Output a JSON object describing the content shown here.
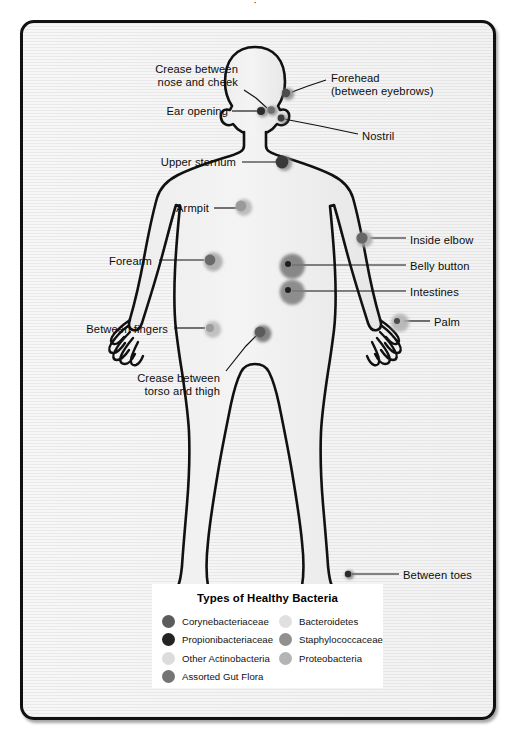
{
  "figure": {
    "top_caption_fragment": "·",
    "body_fill": "#f0f0f0",
    "outline_color": "#111111"
  },
  "callouts": [
    {
      "id": "crease-nose-cheek",
      "label": "Crease between\nnose and cheek",
      "side": "left",
      "text_x": 76,
      "text_y": 43,
      "text_w": 142,
      "line": "224,70 236,78 247,88",
      "dot_x": 251,
      "dot_y": 90,
      "back": {
        "r": 5.0,
        "color": "#8c8c8c"
      },
      "front": {
        "r": 3.8,
        "color": "#6e6e6e"
      }
    },
    {
      "id": "forehead",
      "label": "Forehead\n(between eyebrows)",
      "side": "right",
      "text_x": 311,
      "text_y": 52,
      "text_w": 150,
      "line": "306,60 288,66 272,72",
      "dot_x": 266,
      "dot_y": 73,
      "back": {
        "r": 6.2,
        "color": "#8a8a8a"
      },
      "front": {
        "r": 4.2,
        "color": "#4c4c4c"
      }
    },
    {
      "id": "ear-opening",
      "label": "Ear opening",
      "side": "left",
      "text_x": 110,
      "text_y": 85,
      "text_w": 98,
      "line": "212,91 240,91",
      "dot_x": 241,
      "dot_y": 91,
      "back": {
        "r": 5.4,
        "color": "#8e8e8e"
      },
      "front": {
        "r": 4.0,
        "color": "#2b2b2b"
      }
    },
    {
      "id": "nostril",
      "label": "Nostril",
      "side": "right",
      "text_x": 342,
      "text_y": 110,
      "text_w": 60,
      "line": "338,114 300,106 264,99",
      "dot_x": 261,
      "dot_y": 98,
      "back": {
        "r": 4.6,
        "color": "#8d8d8d"
      },
      "front": {
        "r": 3.4,
        "color": "#3c3c3c"
      }
    },
    {
      "id": "upper-sternum",
      "label": "Upper sternum",
      "side": "left",
      "text_x": 104,
      "text_y": 136,
      "text_w": 112,
      "line": "222,142 258,142",
      "dot_x": 262,
      "dot_y": 142,
      "back": {
        "r": 7.6,
        "color": "#8e8e8e"
      },
      "front": {
        "r": 6.4,
        "color": "#3a3a3a"
      }
    },
    {
      "id": "armpit",
      "label": "Armpit",
      "side": "left",
      "text_x": 131,
      "text_y": 182,
      "text_w": 58,
      "line": "194,188 218,188",
      "dot_x": 221,
      "dot_y": 186,
      "back": {
        "r": 8.4,
        "color": "#b4b4b4"
      },
      "front": {
        "r": 5.4,
        "color": "#9a9a9a"
      }
    },
    {
      "id": "inside-elbow",
      "label": "Inside elbow",
      "side": "right",
      "text_x": 390,
      "text_y": 214,
      "text_w": 100,
      "line": "386,218 350,218",
      "dot_x": 342,
      "dot_y": 218,
      "back": {
        "r": 8.0,
        "color": "#a8a8a8"
      },
      "front": {
        "r": 5.6,
        "color": "#666666"
      }
    },
    {
      "id": "forearm",
      "label": "Forearm",
      "side": "left",
      "text_x": 62,
      "text_y": 235,
      "text_w": 70,
      "line": "139,240 184,240",
      "dot_x": 190,
      "dot_y": 240,
      "back": {
        "r": 9.6,
        "color": "#a6a6a6"
      },
      "front": {
        "r": 5.4,
        "color": "#6a6a6a"
      }
    },
    {
      "id": "belly-button",
      "label": "Belly button",
      "side": "right",
      "text_x": 390,
      "text_y": 240,
      "text_w": 100,
      "line": "386,245 272,245",
      "dot_x": 268,
      "dot_y": 244,
      "back": {
        "r": 12.6,
        "color": "#767676"
      },
      "front": {
        "r": 3.0,
        "color": "#1e1e1e"
      }
    },
    {
      "id": "intestines",
      "label": "Intestines",
      "side": "right",
      "text_x": 390,
      "text_y": 266,
      "text_w": 100,
      "line": "386,271 272,271",
      "dot_x": 268,
      "dot_y": 270,
      "back": {
        "r": 12.6,
        "color": "#7d7d7d"
      },
      "front": {
        "r": 3.0,
        "color": "#1e1e1e"
      }
    },
    {
      "id": "palm",
      "label": "Palm",
      "side": "right",
      "text_x": 414,
      "text_y": 296,
      "text_w": 60,
      "line": "410,301 384,301",
      "dot_x": 377,
      "dot_y": 301,
      "back": {
        "r": 9.2,
        "color": "#b0b0b0"
      },
      "front": {
        "r": 3.0,
        "color": "#4a4a4a"
      }
    },
    {
      "id": "between-fingers",
      "label": "Between fingers",
      "side": "left",
      "text_x": 34,
      "text_y": 303,
      "text_w": 114,
      "line": "154,308 185,308",
      "dot_x": 190,
      "dot_y": 308,
      "back": {
        "r": 8.4,
        "color": "#b8b8b8"
      },
      "front": {
        "r": 4.0,
        "color": "#9c9c9c"
      }
    },
    {
      "id": "crease-torso-thigh",
      "label": "Crease between\ntorso and thigh",
      "side": "left",
      "text_x": 88,
      "text_y": 352,
      "text_w": 112,
      "line": "206,351 226,326 236,316",
      "dot_x": 240,
      "dot_y": 312,
      "back": {
        "r": 8.6,
        "color": "#6f6f6f"
      },
      "front": {
        "r": 5.4,
        "color": "#5b5b5b"
      }
    },
    {
      "id": "between-toes",
      "label": "Between toes",
      "side": "right",
      "text_x": 383,
      "text_y": 549,
      "text_w": 110,
      "line": "379,554 332,554",
      "dot_x": 328,
      "dot_y": 554,
      "back": {
        "r": 4.4,
        "color": "#707070"
      },
      "front": {
        "r": 3.2,
        "color": "#2a2a2a"
      }
    }
  ],
  "legend": {
    "title": "Types of Healthy Bacteria",
    "columns": [
      [
        {
          "label": "Corynebacteriaceae",
          "color": "#5b5b5b"
        },
        {
          "label": "Propionibacteriaceae",
          "color": "#232323"
        },
        {
          "label": "Other Actinobacteria",
          "color": "#dcdcdc"
        },
        {
          "label": "Assorted Gut Flora",
          "color": "#747474"
        }
      ],
      [
        {
          "label": "Bacteroidetes",
          "color": "#e0e0e0"
        },
        {
          "label": "Staphylococcaceae",
          "color": "#909090"
        },
        {
          "label": "Proteobacteria",
          "color": "#b4b4b4"
        }
      ]
    ]
  }
}
